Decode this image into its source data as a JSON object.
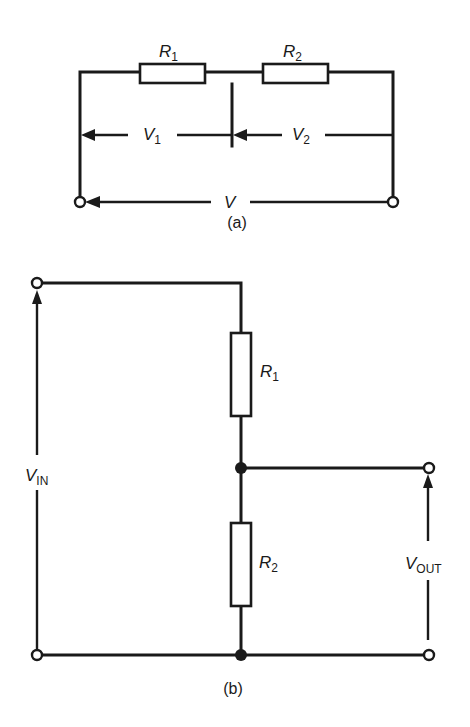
{
  "diagram_a": {
    "caption": "(a)",
    "resistors": [
      {
        "label": "R",
        "sub": "1"
      },
      {
        "label": "R",
        "sub": "2"
      }
    ],
    "voltages": [
      {
        "label": "V",
        "sub": "1"
      },
      {
        "label": "V",
        "sub": "2"
      },
      {
        "label": "V",
        "sub": ""
      }
    ]
  },
  "diagram_b": {
    "caption": "(b)",
    "resistors": [
      {
        "label": "R",
        "sub": "1"
      },
      {
        "label": "R",
        "sub": "2"
      }
    ],
    "input": {
      "label": "V",
      "sub": "IN"
    },
    "output": {
      "label": "V",
      "sub": "OUT"
    }
  },
  "colors": {
    "ink": "#1a1a1a",
    "background": "#ffffff"
  }
}
